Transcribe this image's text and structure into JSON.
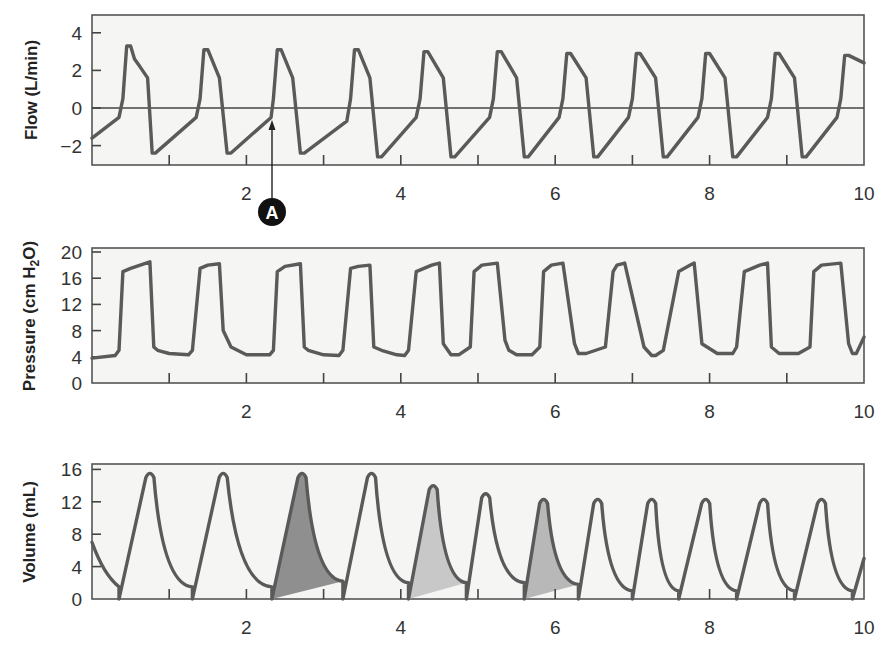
{
  "chart_data": [
    {
      "type": "line",
      "panel": "flow",
      "ylabel": "Flow (L/min)",
      "xlabel": "",
      "xlim": [
        0,
        10
      ],
      "ylim": [
        -3,
        5
      ],
      "yticks": [
        -2,
        0,
        2,
        4
      ],
      "xtick_labels": [
        "2",
        "4",
        "6",
        "8",
        "10"
      ],
      "zero_line": true,
      "grid": false,
      "annotation": {
        "label": "A",
        "x": 2.33,
        "y": -0.5,
        "note": "arrow pointing up to start of inspiration"
      },
      "series": [
        {
          "name": "Flow",
          "x": [
            0.0,
            0.35,
            0.4,
            0.45,
            0.5,
            0.55,
            0.62,
            0.72,
            0.78,
            0.82,
            1.35,
            1.4,
            1.45,
            1.5,
            1.65,
            1.75,
            1.8,
            2.32,
            2.35,
            2.4,
            2.45,
            2.6,
            2.7,
            2.75,
            3.3,
            3.35,
            3.4,
            3.45,
            3.6,
            3.7,
            3.75,
            4.2,
            4.25,
            4.3,
            4.35,
            4.55,
            4.65,
            4.7,
            5.15,
            5.2,
            5.25,
            5.3,
            5.5,
            5.6,
            5.65,
            6.05,
            6.1,
            6.15,
            6.2,
            6.4,
            6.5,
            6.55,
            6.95,
            7.0,
            7.05,
            7.1,
            7.3,
            7.4,
            7.45,
            7.85,
            7.9,
            7.95,
            8.0,
            8.2,
            8.3,
            8.35,
            8.75,
            8.8,
            8.85,
            8.9,
            9.1,
            9.2,
            9.25,
            9.65,
            9.7,
            9.75,
            9.8,
            10.0
          ],
          "y": [
            -1.6,
            -0.5,
            0.5,
            3.3,
            3.3,
            2.6,
            2.2,
            1.6,
            -2.4,
            -2.4,
            -0.5,
            0.5,
            3.1,
            3.1,
            1.6,
            -2.4,
            -2.4,
            -0.5,
            0.5,
            3.1,
            3.1,
            1.6,
            -2.4,
            -2.4,
            -0.7,
            0.5,
            3.1,
            3.1,
            1.6,
            -2.6,
            -2.6,
            -0.5,
            0.5,
            3.0,
            3.0,
            1.6,
            -2.6,
            -2.6,
            -0.5,
            0.5,
            3.0,
            3.0,
            1.6,
            -2.6,
            -2.6,
            -0.5,
            0.5,
            2.9,
            2.9,
            1.6,
            -2.6,
            -2.6,
            -0.5,
            0.5,
            2.9,
            2.9,
            1.6,
            -2.6,
            -2.6,
            -0.5,
            0.5,
            2.9,
            2.9,
            1.6,
            -2.6,
            -2.6,
            -0.5,
            0.5,
            2.9,
            2.9,
            1.6,
            -2.6,
            -2.6,
            -0.5,
            0.5,
            2.8,
            2.8,
            2.4
          ]
        }
      ]
    },
    {
      "type": "line",
      "panel": "pressure",
      "ylabel": "Pressure (cm H2O)",
      "xlabel": "",
      "xlim": [
        0,
        10
      ],
      "ylim": [
        0,
        20
      ],
      "yticks": [
        0,
        4,
        8,
        12,
        16,
        20
      ],
      "xtick_labels": [
        "2",
        "4",
        "6",
        "8",
        "10"
      ],
      "grid": false,
      "series": [
        {
          "name": "Pressure",
          "x": [
            0.0,
            0.3,
            0.35,
            0.4,
            0.5,
            0.75,
            0.8,
            0.85,
            1.0,
            1.25,
            1.3,
            1.4,
            1.5,
            1.65,
            1.7,
            1.8,
            2.0,
            2.3,
            2.35,
            2.4,
            2.5,
            2.7,
            2.75,
            2.8,
            3.0,
            3.2,
            3.25,
            3.35,
            3.45,
            3.6,
            3.65,
            3.75,
            3.95,
            4.05,
            4.1,
            4.2,
            4.4,
            4.5,
            4.55,
            4.65,
            4.75,
            4.9,
            4.95,
            5.05,
            5.25,
            5.35,
            5.4,
            5.5,
            5.7,
            5.8,
            5.85,
            5.95,
            6.1,
            6.25,
            6.3,
            6.4,
            6.65,
            6.75,
            6.8,
            6.9,
            7.15,
            7.25,
            7.3,
            7.4,
            7.6,
            7.75,
            7.8,
            7.9,
            8.1,
            8.3,
            8.35,
            8.45,
            8.65,
            8.75,
            8.8,
            8.9,
            9.15,
            9.3,
            9.35,
            9.45,
            9.7,
            9.8,
            9.85,
            9.9,
            10.0
          ],
          "y": [
            3.8,
            4.2,
            5.0,
            17.0,
            17.5,
            18.5,
            5.5,
            5.0,
            4.5,
            4.3,
            5.0,
            17.5,
            18.0,
            18.2,
            8.0,
            5.5,
            4.3,
            4.3,
            5.0,
            17.0,
            17.8,
            18.2,
            5.5,
            5.0,
            4.3,
            4.2,
            5.0,
            17.5,
            17.8,
            18.0,
            5.5,
            5.0,
            4.3,
            4.2,
            5.0,
            17.0,
            18.0,
            18.3,
            6.0,
            4.3,
            4.3,
            5.5,
            17.0,
            18.0,
            18.3,
            6.5,
            5.0,
            4.3,
            4.3,
            5.5,
            17.0,
            18.0,
            18.3,
            6.0,
            4.5,
            4.5,
            5.5,
            17.0,
            18.0,
            18.3,
            5.5,
            4.2,
            4.2,
            5.0,
            17.0,
            18.0,
            18.3,
            6.0,
            4.5,
            4.5,
            5.5,
            17.0,
            18.0,
            18.3,
            5.5,
            4.5,
            4.5,
            5.5,
            17.0,
            18.0,
            18.3,
            6.0,
            4.5,
            4.5,
            7.0
          ]
        }
      ]
    },
    {
      "type": "area",
      "panel": "volume",
      "ylabel": "Volume (mL)",
      "xlabel": "",
      "xlim": [
        0,
        10
      ],
      "ylim": [
        0,
        16
      ],
      "yticks": [
        0,
        4,
        8,
        12,
        16
      ],
      "xtick_labels": [
        "2",
        "4",
        "6",
        "8",
        "10"
      ],
      "grid": false,
      "shaded_regions": [
        {
          "x_start": 2.33,
          "x_end": 3.25,
          "peak": 15.5,
          "shade": "#8f8f8f"
        },
        {
          "x_start": 4.1,
          "x_end": 4.85,
          "peak": 14.0,
          "shade": "#c8c8c8"
        },
        {
          "x_start": 5.6,
          "x_end": 6.3,
          "peak": 12.3,
          "shade": "#b8b8b8"
        }
      ],
      "series": [
        {
          "name": "Volume",
          "breaths": [
            {
              "start": 0.35,
              "peak_x": 0.75,
              "peak": 15.5,
              "end": 1.3,
              "end_v": 1.5
            },
            {
              "start": 1.3,
              "peak_x": 1.7,
              "peak": 15.5,
              "end": 2.33,
              "end_v": 1.5
            },
            {
              "start": 2.33,
              "peak_x": 2.72,
              "peak": 15.5,
              "end": 3.25,
              "end_v": 2.2
            },
            {
              "start": 3.25,
              "peak_x": 3.62,
              "peak": 15.5,
              "end": 4.1,
              "end_v": 2.0
            },
            {
              "start": 4.1,
              "peak_x": 4.42,
              "peak": 14.0,
              "end": 4.85,
              "end_v": 2.0
            },
            {
              "start": 4.85,
              "peak_x": 5.1,
              "peak": 13.0,
              "end": 5.6,
              "end_v": 2.0
            },
            {
              "start": 5.6,
              "peak_x": 5.85,
              "peak": 12.3,
              "end": 6.3,
              "end_v": 1.8
            },
            {
              "start": 6.3,
              "peak_x": 6.55,
              "peak": 12.3,
              "end": 7.0,
              "end_v": 1.0
            },
            {
              "start": 7.0,
              "peak_x": 7.25,
              "peak": 12.3,
              "end": 7.6,
              "end_v": 1.0
            },
            {
              "start": 7.6,
              "peak_x": 7.95,
              "peak": 12.3,
              "end": 8.35,
              "end_v": 1.0
            },
            {
              "start": 8.35,
              "peak_x": 8.7,
              "peak": 12.3,
              "end": 9.1,
              "end_v": 1.0
            },
            {
              "start": 9.1,
              "peak_x": 9.45,
              "peak": 12.3,
              "end": 9.85,
              "end_v": 1.0
            }
          ],
          "start_value": 7.0,
          "end_value": 5.0
        }
      ]
    }
  ],
  "labels": {
    "flow_ylabel": "Flow (L/min)",
    "pressure_ylabel_pre": "Pressure (cm H",
    "pressure_ylabel_sub": "2",
    "pressure_ylabel_post": "O)",
    "volume_ylabel": "Volume (mL)",
    "annotation_A": "A",
    "flow_yticks": [
      "4",
      "2",
      "0",
      "−2"
    ],
    "pressure_yticks": [
      "20",
      "16",
      "12",
      "8",
      "4",
      "0"
    ],
    "volume_yticks": [
      "16",
      "12",
      "8",
      "4",
      "0"
    ],
    "xticks": [
      "2",
      "4",
      "6",
      "8",
      "10"
    ]
  },
  "colors": {
    "trace": "#5a5a5a",
    "plot_bg": "#f5f5f4",
    "shade_dark": "#8f8f8f",
    "shade_light": "#c8c8c8",
    "annotation_badge": "#111111"
  }
}
